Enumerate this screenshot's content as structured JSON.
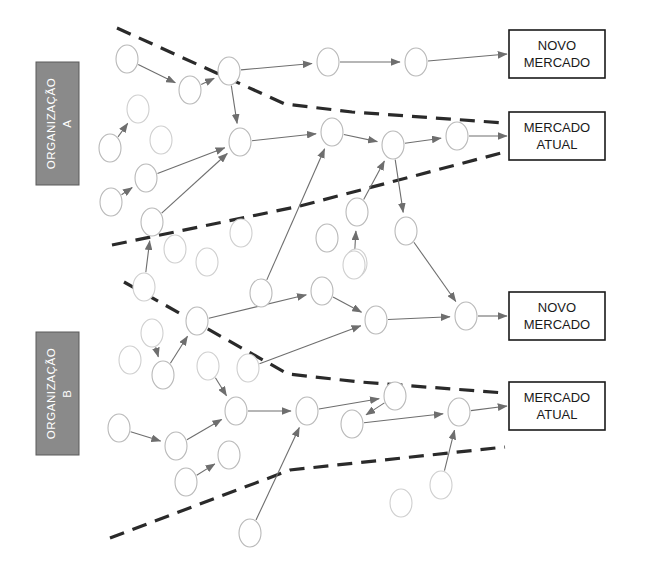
{
  "diagram": {
    "colors": {
      "org_box_fill": "#8a8a8a",
      "org_label_text": "#ffffff",
      "divider_stroke": "#2a2a2a",
      "edge_stroke": "#6e6e6e",
      "node_stroke": "#b9b9b9",
      "node_fill": "#ffffff",
      "market_box_stroke": "#1a1a1a",
      "background": "#ffffff"
    },
    "organizations": [
      {
        "id": "org-a",
        "label_line1": "ORGANIZAÇÃO",
        "label_line2": "A",
        "x": 36,
        "y": 62,
        "width": 43,
        "height": 123
      },
      {
        "id": "org-b",
        "label_line1": "ORGANIZAÇÃO",
        "label_line2": "B",
        "x": 36,
        "y": 332,
        "width": 43,
        "height": 123
      }
    ],
    "markets": [
      {
        "id": "market-novo-a",
        "line1": "NOVO",
        "line2": "MERCADO",
        "x": 509,
        "y": 30,
        "width": 96,
        "height": 48
      },
      {
        "id": "market-atual-a",
        "line1": "MERCADO",
        "line2": "ATUAL",
        "x": 509,
        "y": 112,
        "width": 96,
        "height": 48
      },
      {
        "id": "market-novo-b",
        "line1": "NOVO",
        "line2": "MERCADO",
        "x": 509,
        "y": 292,
        "width": 96,
        "height": 48
      },
      {
        "id": "market-atual-b",
        "line1": "MERCADO",
        "line2": "ATUAL",
        "x": 509,
        "y": 382,
        "width": 96,
        "height": 48
      }
    ],
    "dividers": [
      {
        "id": "divider-1",
        "points": "117,28 285,104 352,112 505,123"
      },
      {
        "id": "divider-2",
        "points": "112,245 300,206 505,152"
      },
      {
        "id": "divider-3",
        "points": "124,282 288,374 360,382 505,393"
      },
      {
        "id": "divider-4",
        "points": "110,538 290,470 505,447"
      }
    ],
    "nodes": [
      {
        "id": "n1",
        "cx": 127,
        "cy": 59,
        "rx": 11,
        "ry": 14,
        "faded": false
      },
      {
        "id": "n2",
        "cx": 190,
        "cy": 90,
        "rx": 11,
        "ry": 14,
        "faded": false
      },
      {
        "id": "n3",
        "cx": 229,
        "cy": 71,
        "rx": 11,
        "ry": 14,
        "faded": false
      },
      {
        "id": "n4",
        "cx": 328,
        "cy": 62,
        "rx": 11,
        "ry": 14,
        "faded": false
      },
      {
        "id": "n5",
        "cx": 416,
        "cy": 62,
        "rx": 11,
        "ry": 14,
        "faded": false
      },
      {
        "id": "n6",
        "cx": 138,
        "cy": 109,
        "rx": 11,
        "ry": 14,
        "faded": true
      },
      {
        "id": "n7",
        "cx": 161,
        "cy": 140,
        "rx": 11,
        "ry": 14,
        "faded": true
      },
      {
        "id": "n8",
        "cx": 110,
        "cy": 148,
        "rx": 11,
        "ry": 14,
        "faded": false
      },
      {
        "id": "n9",
        "cx": 146,
        "cy": 178,
        "rx": 11,
        "ry": 14,
        "faded": false
      },
      {
        "id": "n10",
        "cx": 240,
        "cy": 142,
        "rx": 11,
        "ry": 14,
        "faded": false
      },
      {
        "id": "n11",
        "cx": 111,
        "cy": 202,
        "rx": 11,
        "ry": 14,
        "faded": false
      },
      {
        "id": "n12",
        "cx": 152,
        "cy": 222,
        "rx": 11,
        "ry": 14,
        "faded": false
      },
      {
        "id": "n13",
        "cx": 144,
        "cy": 287,
        "rx": 11,
        "ry": 14,
        "faded": true
      },
      {
        "id": "n14",
        "cx": 175,
        "cy": 249,
        "rx": 11,
        "ry": 14,
        "faded": true
      },
      {
        "id": "n15",
        "cx": 207,
        "cy": 262,
        "rx": 11,
        "ry": 14,
        "faded": true
      },
      {
        "id": "n16",
        "cx": 241,
        "cy": 233,
        "rx": 11,
        "ry": 14,
        "faded": true
      },
      {
        "id": "n17",
        "cx": 332,
        "cy": 132,
        "rx": 11,
        "ry": 14,
        "faded": false
      },
      {
        "id": "n18",
        "cx": 393,
        "cy": 145,
        "rx": 11,
        "ry": 14,
        "faded": false
      },
      {
        "id": "n19",
        "cx": 457,
        "cy": 136,
        "rx": 11,
        "ry": 14,
        "faded": false
      },
      {
        "id": "n20",
        "cx": 357,
        "cy": 212,
        "rx": 11,
        "ry": 14,
        "faded": false
      },
      {
        "id": "n21",
        "cx": 327,
        "cy": 238,
        "rx": 11,
        "ry": 14,
        "faded": false
      },
      {
        "id": "n22",
        "cx": 356,
        "cy": 263,
        "rx": 11,
        "ry": 14,
        "faded": true
      },
      {
        "id": "n23",
        "cx": 406,
        "cy": 231,
        "rx": 11,
        "ry": 14,
        "faded": false
      },
      {
        "id": "n24",
        "cx": 261,
        "cy": 293,
        "rx": 11,
        "ry": 14,
        "faded": false
      },
      {
        "id": "n25",
        "cx": 322,
        "cy": 291,
        "rx": 11,
        "ry": 14,
        "faded": false
      },
      {
        "id": "n26",
        "cx": 376,
        "cy": 320,
        "rx": 11,
        "ry": 14,
        "faded": false
      },
      {
        "id": "n27",
        "cx": 466,
        "cy": 316,
        "rx": 11,
        "ry": 14,
        "faded": false
      },
      {
        "id": "n28",
        "cx": 197,
        "cy": 321,
        "rx": 11,
        "ry": 14,
        "faded": false
      },
      {
        "id": "n29",
        "cx": 152,
        "cy": 333,
        "rx": 11,
        "ry": 14,
        "faded": true
      },
      {
        "id": "n30",
        "cx": 130,
        "cy": 360,
        "rx": 11,
        "ry": 14,
        "faded": true
      },
      {
        "id": "n31",
        "cx": 163,
        "cy": 375,
        "rx": 11,
        "ry": 14,
        "faded": false
      },
      {
        "id": "n32",
        "cx": 208,
        "cy": 366,
        "rx": 11,
        "ry": 14,
        "faded": true
      },
      {
        "id": "n33",
        "cx": 248,
        "cy": 368,
        "rx": 11,
        "ry": 14,
        "faded": true
      },
      {
        "id": "n34",
        "cx": 236,
        "cy": 411,
        "rx": 11,
        "ry": 14,
        "faded": false
      },
      {
        "id": "n35",
        "cx": 119,
        "cy": 428,
        "rx": 11,
        "ry": 14,
        "faded": false
      },
      {
        "id": "n36",
        "cx": 176,
        "cy": 446,
        "rx": 11,
        "ry": 14,
        "faded": false
      },
      {
        "id": "n37",
        "cx": 229,
        "cy": 455,
        "rx": 11,
        "ry": 14,
        "faded": false
      },
      {
        "id": "n38",
        "cx": 186,
        "cy": 482,
        "rx": 11,
        "ry": 14,
        "faded": false
      },
      {
        "id": "n39",
        "cx": 307,
        "cy": 411,
        "rx": 11,
        "ry": 14,
        "faded": false
      },
      {
        "id": "n40",
        "cx": 395,
        "cy": 396,
        "rx": 11,
        "ry": 14,
        "faded": false
      },
      {
        "id": "n41",
        "cx": 352,
        "cy": 424,
        "rx": 11,
        "ry": 14,
        "faded": false
      },
      {
        "id": "n42",
        "cx": 459,
        "cy": 412,
        "rx": 11,
        "ry": 14,
        "faded": false
      },
      {
        "id": "n43",
        "cx": 441,
        "cy": 485,
        "rx": 11,
        "ry": 14,
        "faded": true
      },
      {
        "id": "n44",
        "cx": 401,
        "cy": 503,
        "rx": 11,
        "ry": 14,
        "faded": true
      },
      {
        "id": "n45",
        "cx": 250,
        "cy": 533,
        "rx": 11,
        "ry": 14,
        "faded": false
      },
      {
        "id": "n46",
        "cx": 354,
        "cy": 265,
        "rx": 11,
        "ry": 14,
        "faded": true
      }
    ],
    "edges": [
      {
        "from": "n1",
        "to": "n2",
        "arrow": true
      },
      {
        "from": "n2",
        "to": "n3",
        "arrow": true
      },
      {
        "from": "n3",
        "to": "n4",
        "arrow": true
      },
      {
        "from": "n4",
        "to": "n5",
        "arrow": true
      },
      {
        "from": "n5",
        "to": "market-novo-a",
        "arrow": true
      },
      {
        "from": "n8",
        "to": "n6",
        "arrow": true
      },
      {
        "from": "n3",
        "to": "n10",
        "arrow": true
      },
      {
        "from": "n11",
        "to": "n9",
        "arrow": true
      },
      {
        "from": "n9",
        "to": "n10",
        "arrow": true
      },
      {
        "from": "n12",
        "to": "n10",
        "arrow": true
      },
      {
        "from": "n13",
        "to": "n12",
        "arrow": true
      },
      {
        "from": "n10",
        "to": "n17",
        "arrow": true
      },
      {
        "from": "n17",
        "to": "n18",
        "arrow": true
      },
      {
        "from": "n18",
        "to": "n19",
        "arrow": true
      },
      {
        "from": "n19",
        "to": "market-atual-a",
        "arrow": true
      },
      {
        "from": "n24",
        "to": "n17",
        "arrow": true
      },
      {
        "from": "n20",
        "to": "n18",
        "arrow": true
      },
      {
        "from": "n46",
        "to": "n20",
        "arrow": true
      },
      {
        "from": "n18",
        "to": "n23",
        "arrow": true
      },
      {
        "from": "n23",
        "to": "n27",
        "arrow": true
      },
      {
        "from": "n25",
        "to": "n26",
        "arrow": true
      },
      {
        "from": "n28",
        "to": "n25",
        "arrow": true
      },
      {
        "from": "n26",
        "to": "n27",
        "arrow": true
      },
      {
        "from": "n27",
        "to": "market-novo-b",
        "arrow": true
      },
      {
        "from": "n29",
        "to": "n31",
        "arrow": true
      },
      {
        "from": "n31",
        "to": "n28",
        "arrow": true
      },
      {
        "from": "n33",
        "to": "n26",
        "arrow": true
      },
      {
        "from": "n32",
        "to": "n34",
        "arrow": true
      },
      {
        "from": "n34",
        "to": "n39",
        "arrow": true
      },
      {
        "from": "n35",
        "to": "n36",
        "arrow": true
      },
      {
        "from": "n36",
        "to": "n34",
        "arrow": true
      },
      {
        "from": "n38",
        "to": "n37",
        "arrow": true
      },
      {
        "from": "n39",
        "to": "n40",
        "arrow": true
      },
      {
        "from": "n40",
        "to": "n41",
        "arrow": true
      },
      {
        "from": "n41",
        "to": "n42",
        "arrow": true
      },
      {
        "from": "n42",
        "to": "market-atual-b",
        "arrow": true
      },
      {
        "from": "n45",
        "to": "n39",
        "arrow": true
      },
      {
        "from": "n43",
        "to": "n42",
        "arrow": true
      }
    ]
  }
}
